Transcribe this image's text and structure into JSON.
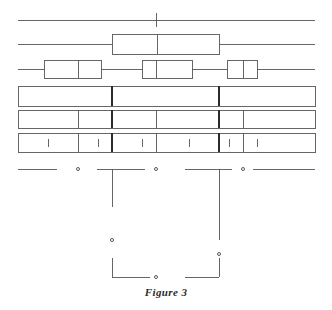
{
  "figure": {
    "caption": "Figure 3",
    "width": 332,
    "height": 310,
    "background": "#ffffff",
    "line_color": "#555555",
    "heavy_line_color": "#2b2b2b",
    "caption_color": "#2b2b2b"
  },
  "chart_data": {
    "type": "diagram",
    "title": "Figure 3",
    "subtitle": "",
    "xlabel": "",
    "ylabel": "",
    "grid": false,
    "legend": "none",
    "axis_range": [
      18,
      315
    ],
    "rows": [
      {
        "name": "row-1-axis-line",
        "kind": "axis",
        "y": 20,
        "x_start": 18,
        "x_end": 315,
        "ticks": [
          156
        ],
        "tick_half_height": 7
      },
      {
        "name": "row-2-boxplot",
        "kind": "boxplot",
        "y": 44,
        "half_height": 10,
        "boxes": [
          {
            "whisker_low": 18,
            "q1": 112,
            "median": 157,
            "q3": 219,
            "whisker_high": 315
          }
        ]
      },
      {
        "name": "row-3-boxplots",
        "kind": "boxplot",
        "y": 69,
        "half_height": 9,
        "boxes": [
          {
            "whisker_low": 18,
            "q1": 44,
            "median": 78,
            "q3": 101,
            "whisker_high": 112
          },
          {
            "whisker_low": 112,
            "q1": 142,
            "median": 156,
            "q3": 192,
            "whisker_high": 219
          },
          {
            "whisker_low": 219,
            "q1": 227,
            "median": 243,
            "q3": 257,
            "whisker_high": 315
          }
        ]
      },
      {
        "name": "row-4-bar",
        "kind": "segmented-bar",
        "y_top": 86,
        "y_bottom": 106,
        "x_start": 18,
        "x_end": 315,
        "dividers": [
          {
            "x": 112,
            "weight": "heavy"
          },
          {
            "x": 219,
            "weight": "heavy"
          }
        ],
        "ticks": []
      },
      {
        "name": "row-5-bar",
        "kind": "segmented-bar",
        "y_top": 110,
        "y_bottom": 128,
        "x_start": 18,
        "x_end": 315,
        "dividers": [
          {
            "x": 78,
            "weight": "light"
          },
          {
            "x": 112,
            "weight": "heavy"
          },
          {
            "x": 156,
            "weight": "light"
          },
          {
            "x": 219,
            "weight": "heavy"
          },
          {
            "x": 243,
            "weight": "light"
          }
        ],
        "ticks": []
      },
      {
        "name": "row-6-bar",
        "kind": "segmented-bar",
        "y_top": 133,
        "y_bottom": 152,
        "x_start": 18,
        "x_end": 315,
        "dividers": [
          {
            "x": 78,
            "weight": "light"
          },
          {
            "x": 112,
            "weight": "heavy"
          },
          {
            "x": 156,
            "weight": "light"
          },
          {
            "x": 219,
            "weight": "heavy"
          },
          {
            "x": 243,
            "weight": "light"
          }
        ],
        "ticks": [
          48,
          98,
          142,
          189,
          229,
          257
        ]
      }
    ],
    "dendrogram": {
      "name": "row-7-bracket-tree",
      "baseline_y": 169,
      "segments": [
        {
          "x_start": 18,
          "x_end": 57
        },
        {
          "x_start": 97,
          "x_end": 145
        },
        {
          "x_start": 185,
          "x_end": 232
        },
        {
          "x_start": 253,
          "x_end": 315
        }
      ],
      "dots": [
        {
          "x": 78,
          "y": 169
        },
        {
          "x": 156,
          "y": 169
        },
        {
          "x": 243,
          "y": 169
        },
        {
          "x": 112,
          "y": 240
        },
        {
          "x": 219,
          "y": 254
        },
        {
          "x": 156,
          "y": 277
        }
      ],
      "stems": [
        {
          "x": 112,
          "y_top": 169,
          "y_bottom": 207
        },
        {
          "x": 219,
          "y_top": 169,
          "y_bottom": 240
        }
      ],
      "brackets": [
        {
          "x_left": 112,
          "x_right": 150,
          "y_top": 258,
          "y_bottom": 277,
          "corner": "left"
        },
        {
          "x_left": 185,
          "x_right": 219,
          "y_top": 258,
          "y_bottom": 277,
          "corner": "right"
        }
      ]
    }
  }
}
